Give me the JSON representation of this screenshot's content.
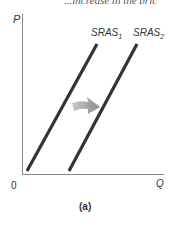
{
  "header_cutoff_text": "...increase in the pric",
  "diagram": {
    "y_axis_label": "P",
    "x_axis_label": "Q",
    "origin_label": "0",
    "curves": [
      {
        "name": "SRAS",
        "subscript": "1",
        "label": "SRAS₁",
        "x1": 27,
        "y1": 171,
        "x2": 97,
        "y2": 44
      },
      {
        "name": "SRAS",
        "subscript": "2",
        "label": "SRAS₂",
        "x1": 69,
        "y1": 171,
        "x2": 137,
        "y2": 44
      }
    ],
    "shift_arrow": {
      "direction": "right",
      "color": "#a8a8a8"
    },
    "caption": "(a)",
    "line_color": "#333333",
    "axis_color": "#888888"
  }
}
